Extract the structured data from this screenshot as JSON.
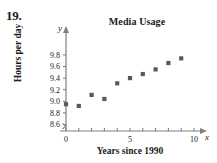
{
  "exercise": {
    "number": "19."
  },
  "chart_data": {
    "type": "scatter",
    "title": "Media Usage",
    "xlabel": "Years since 1990",
    "ylabel": "Hours per day",
    "x_axis_variable": "x",
    "y_axis_variable": "y",
    "x": [
      0,
      1,
      2,
      3,
      4,
      5,
      6,
      7,
      8,
      9
    ],
    "values": [
      8.95,
      8.92,
      9.11,
      9.04,
      9.31,
      9.4,
      9.47,
      9.55,
      9.66,
      9.74
    ],
    "xlim": [
      0,
      10.6
    ],
    "ylim": [
      8.5,
      9.95
    ],
    "x_ticks": [
      0,
      1,
      2,
      3,
      4,
      5,
      6,
      7,
      8,
      9,
      10
    ],
    "x_tick_labels": [
      "0",
      "",
      "",
      "",
      "",
      "5",
      "",
      "",
      "",
      "",
      "10"
    ],
    "y_ticks": [
      8.6,
      8.8,
      9.0,
      9.2,
      9.4,
      9.6,
      9.8
    ],
    "y_tick_labels": [
      "8.6",
      "8.8",
      "9.0",
      "9.2",
      "9.4",
      "9.6",
      "9.8"
    ],
    "grid": false,
    "legend": null,
    "y_axis_break": true,
    "marker": "square",
    "marker_color": "#595959",
    "axis_color": "#808080"
  }
}
